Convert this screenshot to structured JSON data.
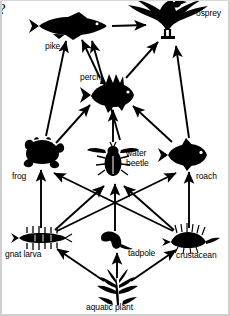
{
  "page": {
    "question_text": "ners?",
    "background_color": "#ffffff",
    "ink_color": "#000000"
  },
  "diagram": {
    "type": "food-web",
    "arrow_meaning": "energy flow from prey to predator",
    "organisms": [
      {
        "id": "osprey",
        "label": "osprey",
        "trophic_level": 4,
        "x": 166,
        "y": 22,
        "label_x": 196,
        "label_y": 9,
        "icon": "osprey-icon"
      },
      {
        "id": "pike",
        "label": "pike",
        "trophic_level": 3,
        "x": 73,
        "y": 26,
        "label_x": 45,
        "label_y": 42,
        "icon": "pike-icon"
      },
      {
        "id": "perch",
        "label": "perch",
        "trophic_level": 3,
        "x": 111,
        "y": 95,
        "label_x": 80,
        "label_y": 73,
        "icon": "perch-icon"
      },
      {
        "id": "frog",
        "label": "frog",
        "trophic_level": 2,
        "x": 42,
        "y": 152,
        "label_x": 12,
        "label_y": 172,
        "icon": "frog-icon"
      },
      {
        "id": "water-beetle",
        "label": "water beetle",
        "trophic_level": 2,
        "x": 113,
        "y": 160,
        "label_x": 126,
        "label_y": 149,
        "icon": "water-beetle-icon"
      },
      {
        "id": "roach",
        "label": "roach",
        "trophic_level": 2,
        "x": 186,
        "y": 155,
        "label_x": 196,
        "label_y": 172,
        "icon": "roach-icon"
      },
      {
        "id": "gnat-larva",
        "label": "gnat larva",
        "trophic_level": 1,
        "x": 41,
        "y": 238,
        "label_x": 5,
        "label_y": 250,
        "icon": "gnat-larva-icon"
      },
      {
        "id": "tadpole",
        "label": "tadpole",
        "trophic_level": 1,
        "x": 115,
        "y": 240,
        "label_x": 128,
        "label_y": 249,
        "icon": "tadpole-icon"
      },
      {
        "id": "crustacean",
        "label": "crustacean",
        "trophic_level": 1,
        "x": 189,
        "y": 240,
        "label_x": 176,
        "label_y": 251,
        "icon": "crustacean-icon"
      },
      {
        "id": "aquatic-plant",
        "label": "aquatic plant",
        "trophic_level": 0,
        "x": 117,
        "y": 289,
        "label_x": 86,
        "label_y": 303,
        "icon": "aquatic-plant-icon"
      }
    ],
    "arrows": [
      {
        "from": "pike",
        "to": "osprey"
      },
      {
        "from": "perch",
        "to": "pike"
      },
      {
        "from": "perch",
        "to": "osprey"
      },
      {
        "from": "frog",
        "to": "pike"
      },
      {
        "from": "water-beetle",
        "to": "perch"
      },
      {
        "from": "water-beetle",
        "to": "pike"
      },
      {
        "from": "roach",
        "to": "perch"
      },
      {
        "from": "roach",
        "to": "osprey"
      },
      {
        "from": "frog",
        "to": "perch"
      },
      {
        "from": "gnat-larva",
        "to": "frog"
      },
      {
        "from": "gnat-larva",
        "to": "water-beetle"
      },
      {
        "from": "gnat-larva",
        "to": "roach"
      },
      {
        "from": "tadpole",
        "to": "water-beetle"
      },
      {
        "from": "crustacean",
        "to": "frog"
      },
      {
        "from": "crustacean",
        "to": "water-beetle"
      },
      {
        "from": "crustacean",
        "to": "roach"
      },
      {
        "from": "aquatic-plant",
        "to": "gnat-larva"
      },
      {
        "from": "aquatic-plant",
        "to": "tadpole"
      },
      {
        "from": "aquatic-plant",
        "to": "crustacean"
      }
    ]
  }
}
